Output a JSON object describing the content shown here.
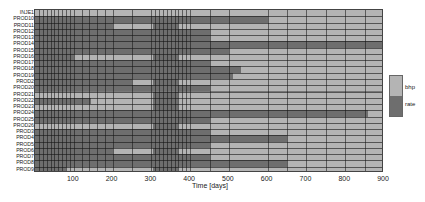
{
  "chart_data": {
    "type": "heatmap",
    "title": "",
    "xlabel": "Time [days]",
    "ylabel": "",
    "xlim": [
      0,
      900
    ],
    "x_ticks": [
      100,
      200,
      300,
      400,
      500,
      600,
      700,
      800,
      900
    ],
    "categories": [
      "INJE1",
      "PROD10",
      "PROD11",
      "PROD12",
      "PROD13",
      "PROD14",
      "PROD15",
      "PROD16",
      "PROD17",
      "PROD18",
      "PROD19",
      "PROD2",
      "PROD20",
      "PROD21",
      "PROD22",
      "PROD23",
      "PROD24",
      "PROD25",
      "PROD26",
      "PROD3",
      "PROD4",
      "PROD5",
      "PROD6",
      "PROD7",
      "PROD8",
      "PROD9"
    ],
    "legend": [
      {
        "label": "bhp",
        "color": "#b4b4b4"
      },
      {
        "label": "rate",
        "color": "#6e6e6e"
      }
    ],
    "legend_position": "right",
    "grid": true,
    "rows": [
      {
        "name": "INJE1",
        "segments": [
          [
            0,
            900,
            "bhp"
          ]
        ]
      },
      {
        "name": "PROD10",
        "segments": [
          [
            0,
            600,
            "rate"
          ],
          [
            600,
            900,
            "bhp"
          ]
        ]
      },
      {
        "name": "PROD11",
        "segments": [
          [
            0,
            200,
            "rate"
          ],
          [
            200,
            305,
            "bhp"
          ],
          [
            305,
            370,
            "rate"
          ],
          [
            370,
            900,
            "bhp"
          ]
        ]
      },
      {
        "name": "PROD12",
        "segments": [
          [
            0,
            450,
            "rate"
          ],
          [
            450,
            900,
            "bhp"
          ]
        ]
      },
      {
        "name": "PROD13",
        "segments": [
          [
            0,
            450,
            "rate"
          ],
          [
            450,
            900,
            "bhp"
          ]
        ]
      },
      {
        "name": "PROD14",
        "segments": [
          [
            0,
            900,
            "rate"
          ]
        ]
      },
      {
        "name": "PROD15",
        "segments": [
          [
            0,
            500,
            "rate"
          ],
          [
            500,
            900,
            "bhp"
          ]
        ]
      },
      {
        "name": "PROD16",
        "segments": [
          [
            0,
            100,
            "rate"
          ],
          [
            100,
            305,
            "bhp"
          ],
          [
            305,
            370,
            "rate"
          ],
          [
            370,
            900,
            "bhp"
          ]
        ]
      },
      {
        "name": "PROD17",
        "segments": [
          [
            0,
            450,
            "rate"
          ],
          [
            450,
            900,
            "bhp"
          ]
        ]
      },
      {
        "name": "PROD18",
        "segments": [
          [
            0,
            530,
            "rate"
          ],
          [
            530,
            900,
            "bhp"
          ]
        ]
      },
      {
        "name": "PROD19",
        "segments": [
          [
            0,
            510,
            "rate"
          ],
          [
            510,
            900,
            "bhp"
          ]
        ]
      },
      {
        "name": "PROD2",
        "segments": [
          [
            0,
            250,
            "rate"
          ],
          [
            250,
            305,
            "bhp"
          ],
          [
            305,
            370,
            "rate"
          ],
          [
            370,
            900,
            "bhp"
          ]
        ]
      },
      {
        "name": "PROD20",
        "segments": [
          [
            0,
            450,
            "rate"
          ],
          [
            450,
            900,
            "bhp"
          ]
        ]
      },
      {
        "name": "PROD21",
        "segments": [
          [
            0,
            305,
            "bhp"
          ],
          [
            305,
            370,
            "rate"
          ],
          [
            370,
            900,
            "bhp"
          ]
        ]
      },
      {
        "name": "PROD22",
        "segments": [
          [
            0,
            145,
            "rate"
          ],
          [
            145,
            305,
            "bhp"
          ],
          [
            305,
            370,
            "rate"
          ],
          [
            370,
            900,
            "bhp"
          ]
        ]
      },
      {
        "name": "PROD23",
        "segments": [
          [
            0,
            305,
            "bhp"
          ],
          [
            305,
            370,
            "rate"
          ],
          [
            370,
            900,
            "bhp"
          ]
        ]
      },
      {
        "name": "PROD24",
        "segments": [
          [
            0,
            860,
            "rate"
          ],
          [
            860,
            900,
            "bhp"
          ]
        ]
      },
      {
        "name": "PROD25",
        "segments": [
          [
            0,
            450,
            "rate"
          ],
          [
            450,
            900,
            "bhp"
          ]
        ]
      },
      {
        "name": "PROD26",
        "segments": [
          [
            0,
            305,
            "bhp"
          ],
          [
            305,
            370,
            "rate"
          ],
          [
            370,
            900,
            "bhp"
          ]
        ]
      },
      {
        "name": "PROD3",
        "segments": [
          [
            0,
            450,
            "rate"
          ],
          [
            450,
            900,
            "bhp"
          ]
        ]
      },
      {
        "name": "PROD4",
        "segments": [
          [
            0,
            650,
            "rate"
          ],
          [
            650,
            900,
            "bhp"
          ]
        ]
      },
      {
        "name": "PROD5",
        "segments": [
          [
            0,
            450,
            "rate"
          ],
          [
            450,
            900,
            "bhp"
          ]
        ]
      },
      {
        "name": "PROD6",
        "segments": [
          [
            0,
            200,
            "rate"
          ],
          [
            200,
            305,
            "bhp"
          ],
          [
            305,
            370,
            "rate"
          ],
          [
            370,
            900,
            "bhp"
          ]
        ]
      },
      {
        "name": "PROD7",
        "segments": [
          [
            0,
            450,
            "rate"
          ],
          [
            450,
            900,
            "bhp"
          ]
        ]
      },
      {
        "name": "PROD8",
        "segments": [
          [
            0,
            650,
            "rate"
          ],
          [
            650,
            900,
            "bhp"
          ]
        ]
      },
      {
        "name": "PROD9",
        "segments": [
          [
            0,
            80,
            "rate"
          ],
          [
            80,
            305,
            "bhp"
          ],
          [
            305,
            370,
            "rate"
          ],
          [
            370,
            900,
            "bhp"
          ]
        ]
      }
    ],
    "time_grid_days": [
      0,
      10,
      20,
      30,
      40,
      50,
      60,
      70,
      80,
      90,
      100,
      120,
      140,
      160,
      180,
      200,
      250,
      300,
      310,
      320,
      330,
      340,
      350,
      360,
      370,
      380,
      390,
      400,
      450,
      500,
      600,
      650,
      700,
      750,
      800,
      850,
      900
    ]
  }
}
